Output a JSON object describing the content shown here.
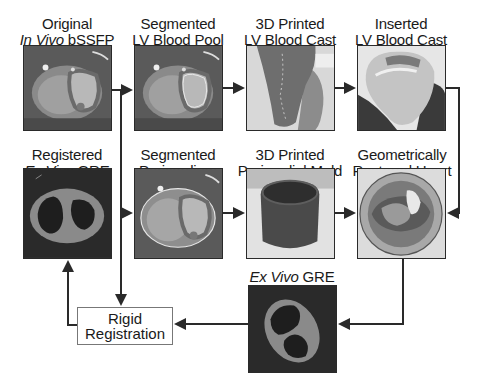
{
  "diagram": {
    "nodes": [
      {
        "id": "original-invivo",
        "line1": "Original",
        "line2_italic": "In Vivo",
        "line2_rest": " bSSFP"
      },
      {
        "id": "segmented-lv",
        "line1": "Segmented",
        "line2_italic": "",
        "line2_rest": "LV Blood Pool"
      },
      {
        "id": "printed-lv-cast",
        "line1": "3D Printed",
        "line2_italic": "",
        "line2_rest": "LV Blood Cast"
      },
      {
        "id": "inserted-lv-cast",
        "line1": "Inserted",
        "line2_italic": "",
        "line2_rest": "LV Blood Cast"
      },
      {
        "id": "registered-exvivo",
        "line1": "Registered",
        "line2_italic": "Ex Vivo",
        "line2_rest": " GRE"
      },
      {
        "id": "segmented-pericardium",
        "line1": "Segmented",
        "line2_italic": "",
        "line2_rest": "Pericardium"
      },
      {
        "id": "printed-pericardial-mold",
        "line1": "3D Printed",
        "line2_italic": "",
        "line2_rest": "Pericardial Mold"
      },
      {
        "id": "restored-heart",
        "line1": "Geometrically",
        "line2_italic": "",
        "line2_rest": "Restored Heart"
      },
      {
        "id": "exvivo-gre",
        "line1": "",
        "line2_italic": "Ex Vivo",
        "line2_rest": " GRE"
      }
    ],
    "process_box": {
      "line1": "Rigid",
      "line2": "Registration"
    },
    "edges": [
      [
        "original-invivo",
        "segmented-lv"
      ],
      [
        "segmented-lv",
        "printed-lv-cast"
      ],
      [
        "printed-lv-cast",
        "inserted-lv-cast"
      ],
      [
        "inserted-lv-cast",
        "restored-heart"
      ],
      [
        "original-invivo",
        "segmented-pericardium"
      ],
      [
        "original-invivo",
        "rigid-registration"
      ],
      [
        "segmented-pericardium",
        "printed-pericardial-mold"
      ],
      [
        "printed-pericardial-mold",
        "restored-heart"
      ],
      [
        "restored-heart",
        "exvivo-gre"
      ],
      [
        "exvivo-gre",
        "rigid-registration"
      ],
      [
        "rigid-registration",
        "registered-exvivo"
      ]
    ],
    "colors": {
      "line": "#2a2a2a",
      "box_border": "#777777"
    }
  }
}
